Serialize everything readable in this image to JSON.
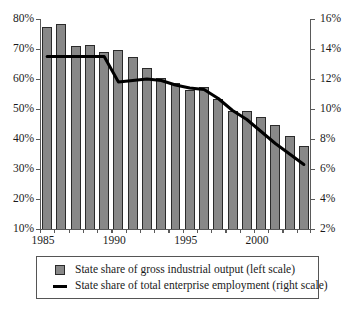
{
  "chart_data": {
    "type": "bar",
    "title": "",
    "subtitle": "",
    "xlabel": "",
    "ylabel": "",
    "grid": false,
    "legend_position": "bottom",
    "categories": [
      "1985",
      "1986",
      "1987",
      "1988",
      "1989",
      "1990",
      "1991",
      "1992",
      "1993",
      "1994",
      "1995",
      "1996",
      "1997",
      "1998",
      "1999",
      "2000",
      "2001",
      "2002",
      "2003"
    ],
    "x_tick_labels": [
      "1985",
      "1990",
      "1995",
      "2000"
    ],
    "x_tick_label_years": [
      1985,
      1990,
      1995,
      2000
    ],
    "left_axis": {
      "label": "",
      "ylim": [
        10,
        80
      ],
      "tick_step": 10,
      "tick_labels": [
        "10%",
        "20%",
        "30%",
        "40%",
        "50%",
        "60%",
        "70%",
        "80%"
      ],
      "tick_values": [
        10,
        20,
        30,
        40,
        50,
        60,
        70,
        80
      ]
    },
    "right_axis": {
      "label": "",
      "ylim": [
        2,
        16
      ],
      "tick_step": 2,
      "tick_labels": [
        "2%",
        "4%",
        "6%",
        "8%",
        "10%",
        "12%",
        "14%",
        "16%"
      ],
      "tick_values": [
        2,
        4,
        6,
        8,
        10,
        12,
        14,
        16
      ]
    },
    "series": [
      {
        "name": "State share of gross industrial output (left scale)",
        "type": "bar",
        "axis": "left",
        "color": "#888888",
        "edge_color": "#2a2a2a",
        "values": [
          77.5,
          78.5,
          71.0,
          71.2,
          69.0,
          69.7,
          67.2,
          63.8,
          60.2,
          58.8,
          56.2,
          57.2,
          53.3,
          49.3,
          49.2,
          47.2,
          44.8,
          41.0,
          37.8
        ]
      },
      {
        "name": "State share of total enterprise employment (right scale)",
        "type": "line",
        "axis": "right",
        "color": "#000000",
        "values": [
          13.5,
          13.5,
          13.5,
          13.5,
          13.5,
          11.8,
          11.9,
          12.0,
          11.9,
          11.6,
          11.4,
          11.3,
          10.7,
          9.9,
          9.3,
          8.5,
          7.7,
          7.0,
          6.3
        ]
      }
    ]
  },
  "legend": {
    "items": [
      {
        "marker": "bar-swatch",
        "label": "State share of gross industrial output (left scale)"
      },
      {
        "marker": "line-swatch",
        "label": "State share of total enterprise employment (right scale)"
      }
    ]
  }
}
